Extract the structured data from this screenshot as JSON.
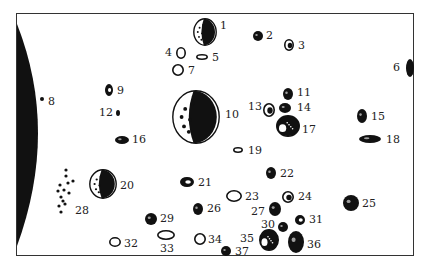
{
  "diagram": {
    "type": "numbered-object-field",
    "colors": {
      "ink": "#111111",
      "frame": "#333333",
      "background": "#ffffff"
    },
    "planet_limb": {
      "side": "left",
      "color": "#111111"
    },
    "objects": [
      {
        "id": "1",
        "label": "1",
        "x": 205,
        "y": 32,
        "rx": 12,
        "ry": 14,
        "style": "half-shaded",
        "lx": 220,
        "ly": 20
      },
      {
        "id": "2",
        "label": "2",
        "x": 258,
        "y": 36,
        "rx": 5,
        "ry": 5,
        "style": "dark",
        "lx": 266,
        "ly": 30
      },
      {
        "id": "3",
        "label": "3",
        "x": 289,
        "y": 45,
        "rx": 5,
        "ry": 6,
        "style": "textured",
        "lx": 298,
        "ly": 40
      },
      {
        "id": "4",
        "label": "4",
        "x": 181,
        "y": 53,
        "rx": 5,
        "ry": 6,
        "style": "outline",
        "lx": 165,
        "ly": 47
      },
      {
        "id": "5",
        "label": "5",
        "x": 202,
        "y": 57,
        "rx": 6,
        "ry": 3,
        "style": "outline",
        "lx": 212,
        "ly": 52
      },
      {
        "id": "6",
        "label": "6",
        "x": 410,
        "y": 68,
        "rx": 4,
        "ry": 9,
        "style": "dark",
        "lx": 393,
        "ly": 62
      },
      {
        "id": "7",
        "label": "7",
        "x": 178,
        "y": 70,
        "rx": 6,
        "ry": 6,
        "style": "outline",
        "lx": 188,
        "ly": 65
      },
      {
        "id": "8",
        "label": "8",
        "x": 42,
        "y": 99,
        "rx": 2,
        "ry": 2,
        "style": "dark",
        "lx": 48,
        "ly": 96
      },
      {
        "id": "9",
        "label": "9",
        "x": 109,
        "y": 90,
        "rx": 4,
        "ry": 6,
        "style": "outline-dark",
        "lx": 117,
        "ly": 85
      },
      {
        "id": "10",
        "label": "10",
        "x": 196,
        "y": 117,
        "rx": 24,
        "ry": 27,
        "style": "half-shaded",
        "lx": 225,
        "ly": 109
      },
      {
        "id": "11",
        "label": "11",
        "x": 288,
        "y": 94,
        "rx": 5,
        "ry": 6,
        "style": "dark",
        "lx": 297,
        "ly": 87
      },
      {
        "id": "12",
        "label": "12",
        "x": 118,
        "y": 113,
        "rx": 2,
        "ry": 3,
        "style": "dark",
        "lx": 99,
        "ly": 107
      },
      {
        "id": "13",
        "label": "13",
        "x": 269,
        "y": 110,
        "rx": 6,
        "ry": 7,
        "style": "textured",
        "lx": 248,
        "ly": 101
      },
      {
        "id": "14",
        "label": "14",
        "x": 285,
        "y": 108,
        "rx": 6,
        "ry": 5,
        "style": "dark",
        "lx": 297,
        "ly": 102
      },
      {
        "id": "15",
        "label": "15",
        "x": 362,
        "y": 116,
        "rx": 5,
        "ry": 7,
        "style": "dark",
        "lx": 371,
        "ly": 111
      },
      {
        "id": "16",
        "label": "16",
        "x": 122,
        "y": 140,
        "rx": 7,
        "ry": 4,
        "style": "dark",
        "lx": 132,
        "ly": 134
      },
      {
        "id": "17",
        "label": "17",
        "x": 288,
        "y": 126,
        "rx": 12,
        "ry": 11,
        "style": "textured-dark",
        "lx": 302,
        "ly": 124
      },
      {
        "id": "18",
        "label": "18",
        "x": 370,
        "y": 139,
        "rx": 11,
        "ry": 4,
        "style": "dark",
        "lx": 386,
        "ly": 134
      },
      {
        "id": "19",
        "label": "19",
        "x": 238,
        "y": 150,
        "rx": 5,
        "ry": 3,
        "style": "outline",
        "lx": 248,
        "ly": 145
      },
      {
        "id": "20",
        "label": "20",
        "x": 103,
        "y": 184,
        "rx": 14,
        "ry": 15,
        "style": "half-shaded",
        "lx": 120,
        "ly": 180
      },
      {
        "id": "21",
        "label": "21",
        "x": 187,
        "y": 182,
        "rx": 7,
        "ry": 5,
        "style": "outline-dark",
        "lx": 198,
        "ly": 177
      },
      {
        "id": "22",
        "label": "22",
        "x": 271,
        "y": 173,
        "rx": 5,
        "ry": 6,
        "style": "dark",
        "lx": 280,
        "ly": 168
      },
      {
        "id": "23",
        "label": "23",
        "x": 234,
        "y": 196,
        "rx": 8,
        "ry": 6,
        "style": "outline",
        "lx": 245,
        "ly": 191
      },
      {
        "id": "24",
        "label": "24",
        "x": 288,
        "y": 197,
        "rx": 6,
        "ry": 6,
        "style": "textured",
        "lx": 298,
        "ly": 191
      },
      {
        "id": "25",
        "label": "25",
        "x": 351,
        "y": 203,
        "rx": 8,
        "ry": 8,
        "style": "dark",
        "lx": 362,
        "ly": 198
      },
      {
        "id": "26",
        "label": "26",
        "x": 198,
        "y": 209,
        "rx": 5,
        "ry": 6,
        "style": "dark",
        "lx": 207,
        "ly": 203
      },
      {
        "id": "27",
        "label": "27",
        "x": 275,
        "y": 209,
        "rx": 6,
        "ry": 7,
        "style": "dark",
        "lx": 251,
        "ly": 206
      },
      {
        "id": "28",
        "label": "28",
        "x": 66,
        "y": 208,
        "rx": 3,
        "ry": 3,
        "style": "cluster",
        "lx": 75,
        "ly": 205
      },
      {
        "id": "29",
        "label": "29",
        "x": 151,
        "y": 219,
        "rx": 6,
        "ry": 6,
        "style": "dark",
        "lx": 160,
        "ly": 213
      },
      {
        "id": "30",
        "label": "30",
        "x": 283,
        "y": 227,
        "rx": 5,
        "ry": 5,
        "style": "dark",
        "lx": 261,
        "ly": 219
      },
      {
        "id": "31",
        "label": "31",
        "x": 300,
        "y": 220,
        "rx": 5,
        "ry": 5,
        "style": "outline-dark",
        "lx": 309,
        "ly": 214
      },
      {
        "id": "32",
        "label": "32",
        "x": 115,
        "y": 242,
        "rx": 6,
        "ry": 5,
        "style": "outline",
        "lx": 124,
        "ly": 238
      },
      {
        "id": "33",
        "label": "33",
        "x": 166,
        "y": 235,
        "rx": 9,
        "ry": 5,
        "style": "outline",
        "lx": 160,
        "ly": 243
      },
      {
        "id": "34",
        "label": "34",
        "x": 200,
        "y": 239,
        "rx": 6,
        "ry": 6,
        "style": "outline",
        "lx": 208,
        "ly": 234
      },
      {
        "id": "35",
        "label": "35",
        "x": 269,
        "y": 240,
        "rx": 10,
        "ry": 11,
        "style": "textured-dark",
        "lx": 240,
        "ly": 233
      },
      {
        "id": "36",
        "label": "36",
        "x": 296,
        "y": 242,
        "rx": 8,
        "ry": 11,
        "style": "dark",
        "lx": 307,
        "ly": 239
      },
      {
        "id": "37",
        "label": "37",
        "x": 226,
        "y": 251,
        "rx": 5,
        "ry": 5,
        "style": "dark",
        "lx": 235,
        "ly": 246
      }
    ]
  }
}
